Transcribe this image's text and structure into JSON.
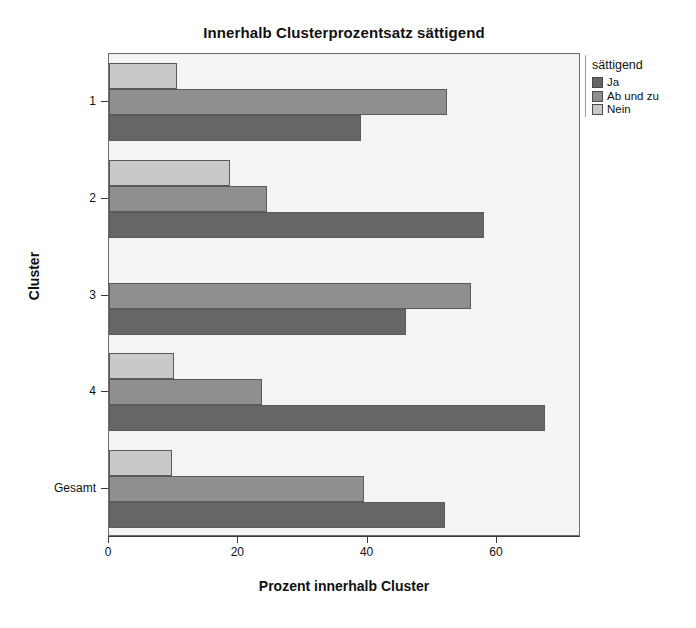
{
  "chart_data": {
    "type": "bar",
    "orientation": "horizontal",
    "title": "Innerhalb Clusterprozentsatz sättigend",
    "xlabel": "Prozent innerhalb Cluster",
    "ylabel": "Cluster",
    "categories": [
      "1",
      "2",
      "3",
      "4",
      "Gesamt"
    ],
    "xlim": [
      0,
      73
    ],
    "xticks": [
      0,
      20,
      40,
      60
    ],
    "xticklabels": [
      "0",
      "20",
      "40",
      "60"
    ],
    "grid": false,
    "legend": {
      "title": "sättigend",
      "position": "right",
      "entries": [
        "Ja",
        "Ab und zu",
        "Nein"
      ]
    },
    "series": [
      {
        "name": "Ja",
        "color": "#666666",
        "values": [
          38.9,
          58.0,
          46.0,
          67.5,
          52.0
        ]
      },
      {
        "name": "Ab und zu",
        "color": "#8f8f8f",
        "values": [
          52.2,
          24.5,
          56.0,
          23.7,
          39.5
        ]
      },
      {
        "name": "Nein",
        "color": "#c9c9c9",
        "values": [
          10.5,
          18.7,
          0,
          10.0,
          9.8
        ]
      }
    ]
  },
  "colors": {
    "ja": "#666666",
    "ab_und_zu": "#8f8f8f",
    "nein": "#c9c9c9",
    "panel_background": "#f4f4f2",
    "frame": "#6d6d6d",
    "axis": "#3a3a3a"
  }
}
